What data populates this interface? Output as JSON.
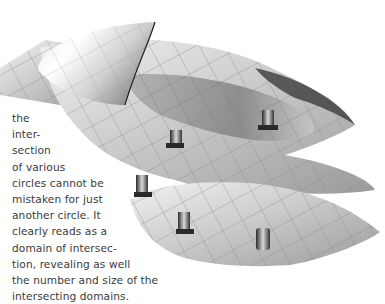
{
  "figure": {
    "colors": {
      "surface_light": "#e6e6e6",
      "surface_mid": "#b8b8b8",
      "surface_dark": "#6e6e6e",
      "grid": "#8a8a8a"
    }
  },
  "caption": {
    "lines": [
      "the",
      "inter-",
      "section",
      "of various",
      "circles cannot be",
      "mistaken for just",
      "another circle. It",
      "clearly reads as a",
      "domain of intersec-",
      "tion, revealing as well",
      "the number and size of the",
      "intersecting domains."
    ]
  }
}
